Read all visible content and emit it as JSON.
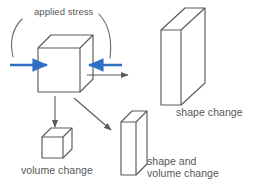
{
  "figure": {
    "kind": "deformation-mechanisms-diagram",
    "background_color": "#ffffff",
    "stroke_color": "#5a5a5a",
    "text_color": "#575757",
    "arrow_stress_color": "#2f6fc4",
    "arrow_flow_color": "#5a5a5a",
    "width": 255,
    "height": 190
  },
  "labels": {
    "applied_stress": "applied stress",
    "shape_change": "shape change",
    "volume_change": "volume change",
    "shape_and_volume_change_line1": "shape and",
    "shape_and_volume_change_line2": "volume change"
  },
  "shapes": {
    "source_cube": {
      "name": "original cube",
      "front_face": {
        "x": 38,
        "y": 48,
        "w": 42,
        "h": 44
      },
      "depth_dx": 13,
      "depth_dy": -13
    },
    "small_cube": {
      "name": "compressed cube",
      "front_face": {
        "x": 42,
        "y": 137,
        "w": 21,
        "h": 21
      },
      "depth_dx": 9,
      "depth_dy": -9
    },
    "medium_slab": {
      "name": "shape and volume change slab",
      "front_face": {
        "x": 121,
        "y": 122,
        "w": 15,
        "h": 53
      },
      "depth_dx": 11,
      "depth_dy": -11
    },
    "large_slab": {
      "name": "shape change slab",
      "front_face": {
        "x": 161,
        "y": 30,
        "w": 20,
        "h": 75
      },
      "depth_dx": 24,
      "depth_dy": -22
    }
  },
  "arrows": {
    "stress_left": {
      "from_x": 10,
      "to_x": 47,
      "y": 65,
      "color": "#2f6fc4"
    },
    "stress_right": {
      "from_x": 87,
      "to_x": 122,
      "y": 65,
      "color": "#2f6fc4"
    },
    "flow_right": {
      "from_x": 87,
      "to_x": 131,
      "y": 75,
      "color": "#5a5a5a"
    },
    "flow_down": {
      "from_x": 55,
      "from_y": 95,
      "to_x": 55,
      "to_y": 130,
      "color": "#5a5a5a"
    },
    "flow_diagonal": {
      "from_x": 73,
      "from_y": 97,
      "to_x": 113,
      "to_y": 132,
      "color": "#5a5a5a"
    }
  },
  "bracket": {
    "name": "applied stress arc",
    "description": "curved arc spanning above the original cube",
    "color": "#6a6a6a"
  }
}
